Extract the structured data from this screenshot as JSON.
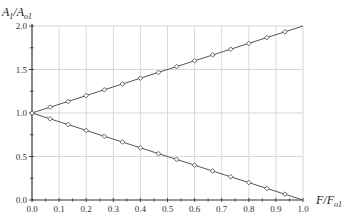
{
  "chart_data": {
    "type": "line",
    "title": "",
    "xlabel": "F/F_o1",
    "ylabel": "A_1/A_o1",
    "xlim": [
      0.0,
      1.0
    ],
    "ylim": [
      0.0,
      2.0
    ],
    "grid": true,
    "legend": null,
    "x_ticks": [
      "0.0",
      "0.1",
      "0.2",
      "0.3",
      "0.4",
      "0.5",
      "0.6",
      "0.7",
      "0.8",
      "0.9",
      "1.0"
    ],
    "y_ticks": [
      "0.0",
      "0.5",
      "1.0",
      "1.5",
      "2.0"
    ],
    "x": [
      0.0,
      0.0667,
      0.1333,
      0.2,
      0.2667,
      0.3333,
      0.4,
      0.4667,
      0.5333,
      0.6,
      0.6667,
      0.7333,
      0.8,
      0.8667,
      0.9333
    ],
    "series": [
      {
        "name": "increasing",
        "values": [
          1.0,
          1.067,
          1.133,
          1.2,
          1.267,
          1.333,
          1.4,
          1.467,
          1.533,
          1.6,
          1.667,
          1.733,
          1.8,
          1.867,
          1.933
        ],
        "line_end": [
          1.0,
          2.0
        ]
      },
      {
        "name": "decreasing",
        "values": [
          1.0,
          0.933,
          0.867,
          0.8,
          0.733,
          0.667,
          0.6,
          0.533,
          0.467,
          0.4,
          0.333,
          0.267,
          0.2,
          0.133,
          0.067
        ],
        "line_end": [
          1.0,
          0.0
        ]
      }
    ]
  },
  "labels": {
    "y_axis_title_main": "A",
    "y_axis_title_sub1": "1",
    "y_axis_title_sep": "/",
    "y_axis_title_main2": "A",
    "y_axis_title_sub2": "o1",
    "x_axis_title_main": "F",
    "x_axis_title_sep": "/",
    "x_axis_title_main2": "F",
    "x_axis_title_sub2": "o1"
  }
}
